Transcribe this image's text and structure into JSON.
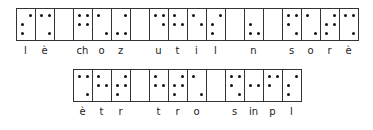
{
  "figure": {
    "rows": [
      {
        "cells": [
          {
            "label": "l",
            "dots": [
              2,
              3,
              4
            ]
          },
          {
            "label": "è",
            "dots": [
              1,
              4,
              6
            ]
          },
          {
            "label": "",
            "dots": []
          },
          {
            "label": "ch",
            "dots": [
              1,
              2,
              4,
              5
            ]
          },
          {
            "label": "o",
            "dots": [
              1,
              6
            ]
          },
          {
            "label": "z",
            "dots": [
              3,
              4,
              6
            ]
          },
          {
            "label": "",
            "dots": []
          },
          {
            "label": "u",
            "dots": [
              1,
              4,
              5
            ]
          },
          {
            "label": "t",
            "dots": [
              1,
              2,
              5
            ]
          },
          {
            "label": "i",
            "dots": [
              1,
              5
            ]
          },
          {
            "label": "l",
            "dots": [
              2,
              3,
              4
            ]
          },
          {
            "label": "",
            "dots": []
          },
          {
            "label": "n",
            "dots": [
              2,
              3,
              6
            ]
          },
          {
            "label": "",
            "dots": []
          },
          {
            "label": "s",
            "dots": [
              1,
              2,
              4,
              6
            ]
          },
          {
            "label": "o",
            "dots": [
              1,
              6
            ]
          },
          {
            "label": "r",
            "dots": [
              2,
              3,
              4,
              5
            ]
          },
          {
            "label": "è",
            "dots": [
              1,
              4,
              6
            ]
          }
        ]
      },
      {
        "cells": [
          {
            "label": "è",
            "dots": [
              1,
              4,
              6
            ]
          },
          {
            "label": "t",
            "dots": [
              1,
              2,
              5
            ]
          },
          {
            "label": "r",
            "dots": [
              2,
              3,
              4,
              5
            ]
          },
          {
            "label": "",
            "dots": []
          },
          {
            "label": "t",
            "dots": [
              1,
              2,
              5
            ]
          },
          {
            "label": "r",
            "dots": [
              2,
              3,
              4,
              5
            ]
          },
          {
            "label": "o",
            "dots": [
              1,
              6
            ]
          },
          {
            "label": "",
            "dots": []
          },
          {
            "label": "s",
            "dots": [
              1,
              2,
              4,
              6
            ]
          },
          {
            "label": "in",
            "dots": [
              2,
              5
            ]
          },
          {
            "label": "p",
            "dots": [
              1,
              2,
              4
            ]
          },
          {
            "label": "l",
            "dots": [
              2,
              3,
              4
            ]
          }
        ]
      }
    ]
  }
}
